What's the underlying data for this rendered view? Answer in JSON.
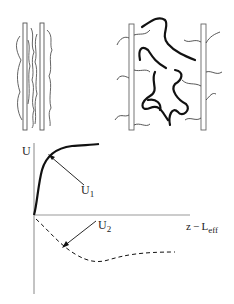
{
  "diagram": {
    "top_left": {
      "description": "Compressed polymer brushes between two plates (interpenetrated)"
    },
    "top_right": {
      "description": "Polymer chains bridging between two separated plates with free tails"
    },
    "graph": {
      "y_axis_label": "U",
      "x_axis_label_main": "z − L",
      "x_axis_label_sub": "eff",
      "curve1_label_main": "U",
      "curve1_label_sub": "1",
      "curve2_label_main": "U",
      "curve2_label_sub": "2",
      "colors": {
        "line": "#111111",
        "axis": "#888888"
      }
    }
  }
}
